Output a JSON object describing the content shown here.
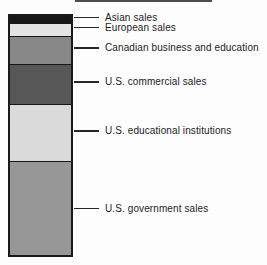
{
  "figure": {
    "background_color": "#fdfdfd",
    "bar_border_color": "#1a1a1a",
    "leader_line_color": "#262626",
    "label_text_color": "#1c1c1c",
    "top_rule_color": "#4d4d4d"
  },
  "chart_data": {
    "type": "bar",
    "subtype": "stacked-single-column",
    "title": "",
    "xlabel": "",
    "ylabel": "",
    "axes_shown": false,
    "gridlines": false,
    "legend_position": "leader-line callouts right of bar",
    "categories": [
      "Asian sales",
      "European sales",
      "Canadian business and education",
      "U.S. commercial sales",
      "U.S. educational institutions",
      "U.S. government sales"
    ],
    "segments": [
      {
        "label": "Asian sales",
        "color": "#181818",
        "height_px": 7,
        "share_pct_est": 2.9
      },
      {
        "label": "European sales",
        "color": "#e3e3e3",
        "height_px": 13,
        "share_pct_est": 5.3
      },
      {
        "label": "Canadian business and education",
        "color": "#878787",
        "height_px": 28,
        "share_pct_est": 11.5
      },
      {
        "label": "U.S. commercial sales",
        "color": "#575757",
        "height_px": 40,
        "share_pct_est": 16.5
      },
      {
        "label": "U.S. educational institutions",
        "color": "#dadada",
        "height_px": 58,
        "share_pct_est": 23.9
      },
      {
        "label": "U.S. government sales",
        "color": "#979797",
        "height_px": 97,
        "share_pct_est": 39.9
      }
    ]
  }
}
